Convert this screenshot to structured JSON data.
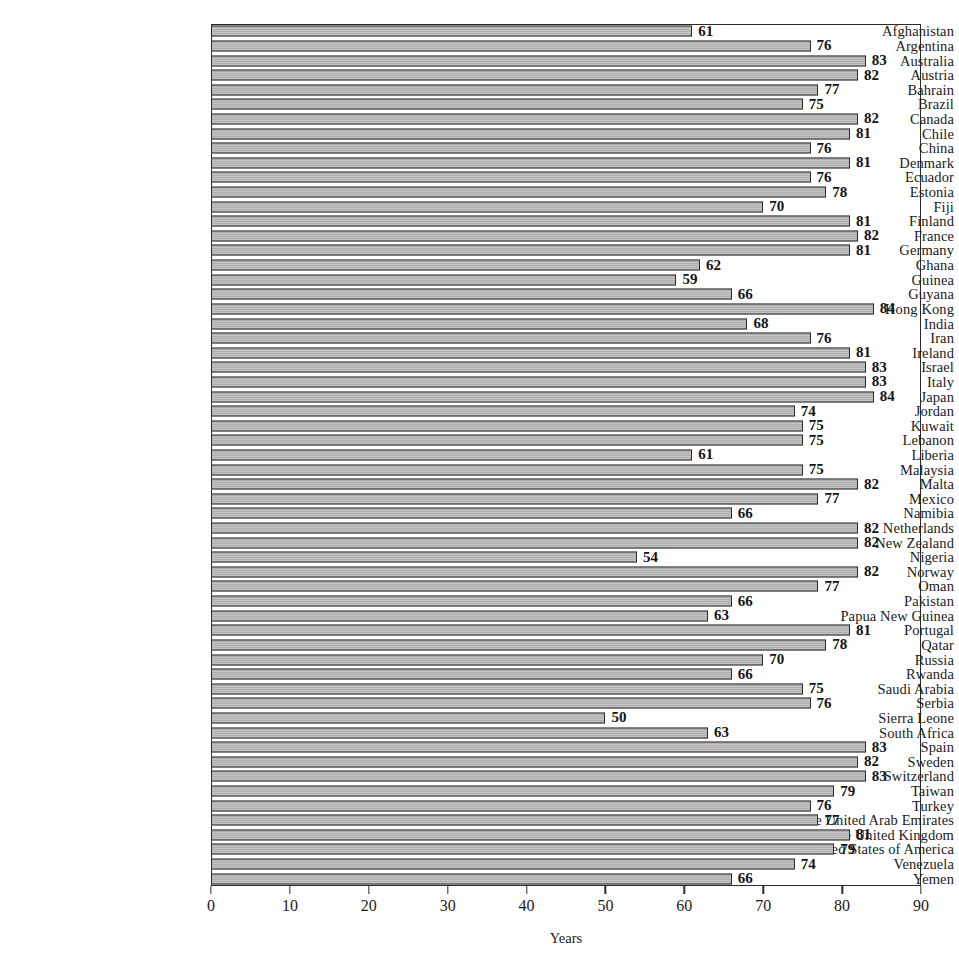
{
  "chart_data": {
    "type": "bar",
    "orientation": "horizontal",
    "title": "",
    "xlabel": "Years",
    "ylabel": "",
    "xlim": [
      0,
      90
    ],
    "xticks": [
      0,
      10,
      20,
      30,
      40,
      50,
      60,
      70,
      80,
      90
    ],
    "grid": false,
    "legend": null,
    "bar_color": "#b9b9b9",
    "bar_edge_color": "#2b2b2b",
    "value_labels": true,
    "categories": [
      "Afghanistan",
      "Argentina",
      "Australia",
      "Austria",
      "Bahrain",
      "Brazil",
      "Canada",
      "Chile",
      "China",
      "Denmark",
      "Ecuador",
      "Estonia",
      "Fiji",
      "Finland",
      "France",
      "Germany",
      "Ghana",
      "Guinea",
      "Guyana",
      "Hong Kong",
      "India",
      "Iran",
      "Ireland",
      "Israel",
      "Italy",
      "Japan",
      "Jordan",
      "Kuwait",
      "Lebanon",
      "Liberia",
      "Malaysia",
      "Malta",
      "Mexico",
      "Namibia",
      "Netherlands",
      "New Zealand",
      "Nigeria",
      "Norway",
      "Oman",
      "Pakistan",
      "Papua New Guinea",
      "Portugal",
      "Qatar",
      "Russia",
      "Rwanda",
      "Saudi Arabia",
      "Serbia",
      "Sierra Leone",
      "South Africa",
      "Spain",
      "Sweden",
      "Switzerland",
      "Taiwan",
      "Turkey",
      "The United Arab Emirates",
      "The United Kingdom",
      "The United States of America",
      "Venezuela",
      "Yemen"
    ],
    "values": [
      61,
      76,
      83,
      82,
      77,
      75,
      82,
      81,
      76,
      81,
      76,
      78,
      70,
      81,
      82,
      81,
      62,
      59,
      66,
      84,
      68,
      76,
      81,
      83,
      83,
      84,
      74,
      75,
      75,
      61,
      75,
      82,
      77,
      66,
      82,
      82,
      54,
      82,
      77,
      66,
      63,
      81,
      78,
      70,
      66,
      75,
      76,
      50,
      63,
      83,
      82,
      83,
      79,
      76,
      77,
      81,
      79,
      74,
      66
    ]
  }
}
